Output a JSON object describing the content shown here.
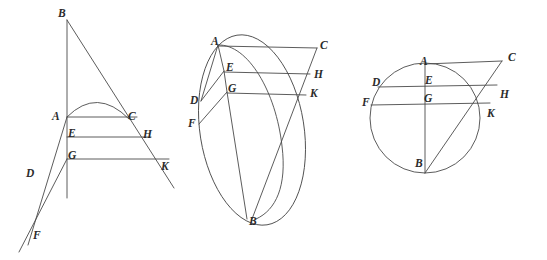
{
  "page": {
    "background_color": "#ffffff",
    "stroke_color": "#4a4a4a",
    "label_color": "#2b2b2b",
    "width": 547,
    "height": 260
  },
  "figures": [
    {
      "id": "figure-1",
      "name": "angle-with-parabolic-arc",
      "labels": [
        {
          "text": "B",
          "x": 58,
          "y": 8
        },
        {
          "text": "A",
          "x": 52,
          "y": 111
        },
        {
          "text": "C",
          "x": 128,
          "y": 111
        },
        {
          "text": "E",
          "x": 68,
          "y": 128
        },
        {
          "text": "H",
          "x": 143,
          "y": 129
        },
        {
          "text": "G",
          "x": 68,
          "y": 150
        },
        {
          "text": "K",
          "x": 161,
          "y": 161
        },
        {
          "text": "D",
          "x": 26,
          "y": 168
        },
        {
          "text": "F",
          "x": 33,
          "y": 230
        }
      ]
    },
    {
      "id": "figure-2",
      "name": "tilted-ellipse-with-chords",
      "labels": [
        {
          "text": "A",
          "x": 211,
          "y": 36
        },
        {
          "text": "C",
          "x": 320,
          "y": 40
        },
        {
          "text": "E",
          "x": 226,
          "y": 62
        },
        {
          "text": "H",
          "x": 314,
          "y": 69
        },
        {
          "text": "G",
          "x": 228,
          "y": 83
        },
        {
          "text": "K",
          "x": 310,
          "y": 88
        },
        {
          "text": "D",
          "x": 190,
          "y": 95
        },
        {
          "text": "F",
          "x": 188,
          "y": 118
        },
        {
          "text": "B",
          "x": 249,
          "y": 216
        }
      ]
    },
    {
      "id": "figure-3",
      "name": "circle-with-diameter-and-secant",
      "labels": [
        {
          "text": "A",
          "x": 420,
          "y": 56
        },
        {
          "text": "C",
          "x": 508,
          "y": 52
        },
        {
          "text": "E",
          "x": 425,
          "y": 75
        },
        {
          "text": "H",
          "x": 500,
          "y": 89
        },
        {
          "text": "G",
          "x": 424,
          "y": 93
        },
        {
          "text": "K",
          "x": 487,
          "y": 108
        },
        {
          "text": "D",
          "x": 372,
          "y": 77
        },
        {
          "text": "F",
          "x": 362,
          "y": 97
        },
        {
          "text": "B",
          "x": 415,
          "y": 158
        }
      ]
    }
  ],
  "geometry_notes": {
    "figure_1": "Vertical axis through B, A, E, G; oblique ray from B through C, H, K; horizontal chords A-C, E-H, G-K; rays from A and G meeting near F with D on ray A-F; parabolic arc springing from A to the oblique ray.",
    "figure_2": "Large tilted ellipse; a second narrow arc from A to B; near-vertical chain A, E, G to B; horizontal chords A-C, E-H, G-K; points D and F on the ellipse at left joined to E and G.",
    "figure_3": "Circle with vertical diameter A-B; horizontal chords D-H through E and F-K through G; secant from B through K to C; chord A-C across the top."
  }
}
